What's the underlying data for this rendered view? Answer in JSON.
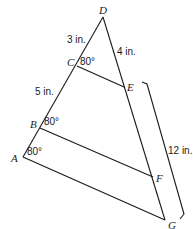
{
  "diagram": {
    "points": {
      "A": {
        "label": "A",
        "x": 23,
        "y": 157
      },
      "B": {
        "label": "B",
        "x": 40,
        "y": 128
      },
      "C": {
        "label": "C",
        "x": 77,
        "y": 66
      },
      "D": {
        "label": "D",
        "x": 103,
        "y": 17
      },
      "E": {
        "label": "E",
        "x": 124,
        "y": 87
      },
      "F": {
        "label": "F",
        "x": 153,
        "y": 177
      },
      "G": {
        "label": "G",
        "x": 165,
        "y": 220
      }
    },
    "lengths": {
      "DC": "3 in.",
      "DE": "4 in.",
      "CB": "5 in.",
      "EG": "12 in."
    },
    "angles": {
      "C": "80°",
      "B": "80°",
      "A": "80°"
    }
  }
}
